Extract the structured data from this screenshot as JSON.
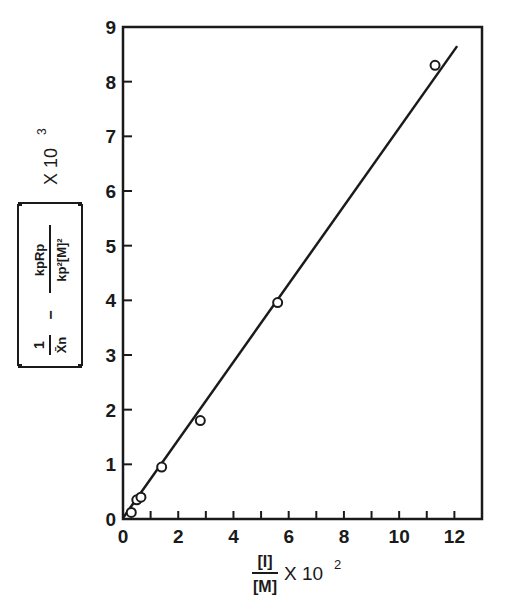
{
  "chart_data": {
    "type": "scatter",
    "title": "",
    "xlabel": "[I]/[M] X 10^2",
    "xlabel_parts": {
      "numerator": "[I]",
      "denominator": "[M]",
      "multiplier": "X 10",
      "exponent": "2"
    },
    "ylabel": "[1/X̄n − kpRp/(kp²[M]²)] X 10^3",
    "ylabel_parts": {
      "term1_num": "1",
      "term1_den": "X̄n",
      "minus": "−",
      "term2_num": "kpRp",
      "term2_den": "kp²[M]²",
      "multiplier": "X 10",
      "exponent": "3"
    },
    "xlim": [
      0,
      13
    ],
    "ylim": [
      0,
      9
    ],
    "x_ticks": [
      0,
      2,
      4,
      6,
      8,
      10,
      12
    ],
    "x_minor_ticks": [
      1,
      3,
      5,
      7,
      9,
      11
    ],
    "y_ticks": [
      0,
      1,
      2,
      3,
      4,
      5,
      6,
      7,
      8,
      9
    ],
    "grid": false,
    "legend": null,
    "series": [
      {
        "name": "data",
        "marker": "open-circle",
        "x": [
          0.3,
          0.5,
          0.65,
          1.4,
          2.8,
          5.6,
          11.3
        ],
        "y": [
          0.12,
          0.35,
          0.4,
          0.95,
          1.8,
          3.96,
          8.3
        ]
      },
      {
        "name": "fit",
        "style": "line",
        "x": [
          0,
          12.1
        ],
        "y": [
          0.02,
          8.65
        ]
      }
    ]
  },
  "colors": {
    "ink": "#1a1a1a",
    "background": "#ffffff"
  }
}
